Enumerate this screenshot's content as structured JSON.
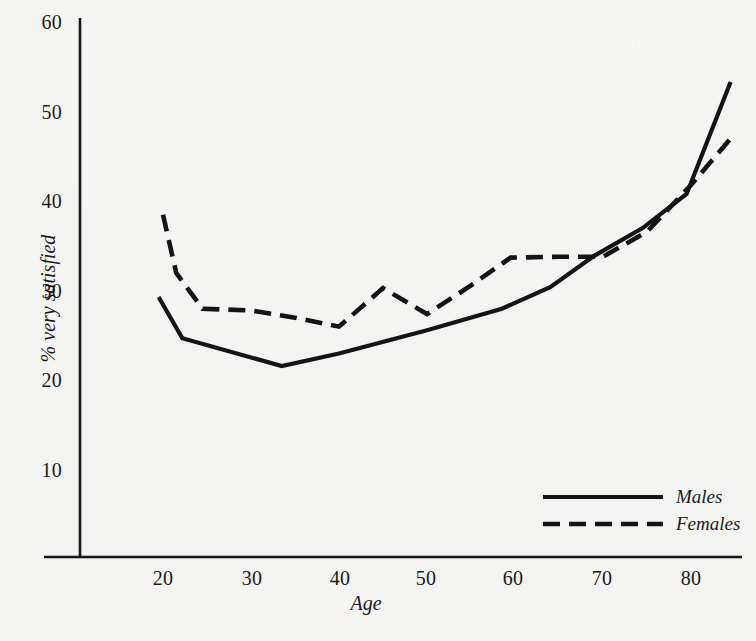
{
  "chart_data": {
    "type": "line",
    "title": "",
    "subtitle": "",
    "xlabel": "Age",
    "ylabel": "% very satisfied",
    "xlim": [
      14,
      88
    ],
    "ylim": [
      0,
      62
    ],
    "xticks": [
      "20",
      "30",
      "40",
      "50",
      "60",
      "70",
      "80"
    ],
    "yticks": [
      "10",
      "20",
      "30",
      "40",
      "50",
      "60"
    ],
    "grid": false,
    "legend_position": "bottom-right",
    "series": [
      {
        "name": "Males",
        "style": "solid",
        "color": "#141414",
        "x": [
          19.5,
          22.2,
          33.5,
          40.0,
          50.0,
          58.5,
          64.0,
          69.0,
          74.5,
          79.5,
          84.5
        ],
        "y": [
          29.3,
          24.7,
          21.6,
          23.0,
          25.6,
          28.0,
          30.4,
          33.9,
          37.0,
          40.8,
          53.3
        ]
      },
      {
        "name": "Females",
        "style": "dashed",
        "color": "#141414",
        "x": [
          20.0,
          21.5,
          24.5,
          30.0,
          35.0,
          40.0,
          45.0,
          50.0,
          55.0,
          59.5,
          65.0,
          70.0,
          75.0,
          80.0,
          84.5
        ],
        "y": [
          38.5,
          32.0,
          28.0,
          27.8,
          27.0,
          26.0,
          30.3,
          27.4,
          30.6,
          33.7,
          33.8,
          33.8,
          36.6,
          41.8,
          47.0
        ]
      }
    ],
    "legend": [
      {
        "label": "Males",
        "style": "solid"
      },
      {
        "label": "Females",
        "style": "dashed"
      }
    ]
  },
  "axes": {
    "y_ticks": [
      {
        "label": "60",
        "value": 60
      },
      {
        "label": "50",
        "value": 50
      },
      {
        "label": "40",
        "value": 40
      },
      {
        "label": "30",
        "value": 30
      },
      {
        "label": "20",
        "value": 20
      },
      {
        "label": "10",
        "value": 10
      }
    ],
    "x_ticks": [
      {
        "label": "20",
        "value": 20
      },
      {
        "label": "30",
        "value": 30
      },
      {
        "label": "40",
        "value": 40
      },
      {
        "label": "50",
        "value": 50
      },
      {
        "label": "60",
        "value": 60
      },
      {
        "label": "70",
        "value": 70
      },
      {
        "label": "80",
        "value": 80
      }
    ],
    "y_title": "% very satisfied",
    "x_title": "Age"
  }
}
